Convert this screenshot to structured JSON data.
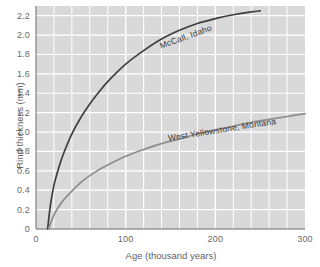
{
  "chart_data": {
    "type": "line",
    "title": "",
    "xlabel": "Age (thousand years)",
    "ylabel": "Rind thickness (mm)",
    "xlim": [
      0,
      300
    ],
    "ylim": [
      0,
      2.3
    ],
    "xticks": [
      0,
      100,
      200,
      300
    ],
    "xtick_labels": [
      "0",
      "100",
      "200",
      "300"
    ],
    "yticks": [
      0,
      0.2,
      0.4,
      0.6,
      0.8,
      1.0,
      1.2,
      1.4,
      1.6,
      1.8,
      2.0,
      2.2
    ],
    "ytick_labels": [
      "0",
      "0.2",
      "0.4",
      "0.6",
      "0.8",
      "1.0",
      "1.2",
      "1.4",
      "1.6",
      "1.8",
      "2.0",
      "2.2"
    ],
    "grid": true,
    "grid_color": "#ffffff",
    "plot_background": "#d9d9d9",
    "legend_position": "inline-curve-labels",
    "series": [
      {
        "name": "McCall, Idaho",
        "color": "#3f3f3f",
        "points": [
          [
            13,
            0.0
          ],
          [
            16,
            0.24
          ],
          [
            20,
            0.45
          ],
          [
            25,
            0.62
          ],
          [
            30,
            0.76
          ],
          [
            40,
            0.98
          ],
          [
            50,
            1.15
          ],
          [
            60,
            1.29
          ],
          [
            70,
            1.41
          ],
          [
            80,
            1.52
          ],
          [
            100,
            1.7
          ],
          [
            120,
            1.84
          ],
          [
            140,
            1.96
          ],
          [
            160,
            2.05
          ],
          [
            180,
            2.12
          ],
          [
            200,
            2.17
          ],
          [
            220,
            2.21
          ],
          [
            240,
            2.24
          ],
          [
            250,
            2.25
          ]
        ]
      },
      {
        "name": "West Yellowstone, Montana",
        "color": "#8c8c8c",
        "points": [
          [
            14,
            0.0
          ],
          [
            18,
            0.1
          ],
          [
            22,
            0.18
          ],
          [
            30,
            0.29
          ],
          [
            40,
            0.39
          ],
          [
            50,
            0.48
          ],
          [
            60,
            0.55
          ],
          [
            70,
            0.61
          ],
          [
            80,
            0.66
          ],
          [
            100,
            0.75
          ],
          [
            120,
            0.82
          ],
          [
            140,
            0.88
          ],
          [
            160,
            0.93
          ],
          [
            180,
            0.98
          ],
          [
            200,
            1.02
          ],
          [
            220,
            1.06
          ],
          [
            240,
            1.1
          ],
          [
            260,
            1.13
          ],
          [
            280,
            1.16
          ],
          [
            300,
            1.19
          ]
        ]
      }
    ]
  },
  "axes": {
    "x_title": "Age (thousand years)",
    "y_title": "Rind thickness (mm)"
  }
}
